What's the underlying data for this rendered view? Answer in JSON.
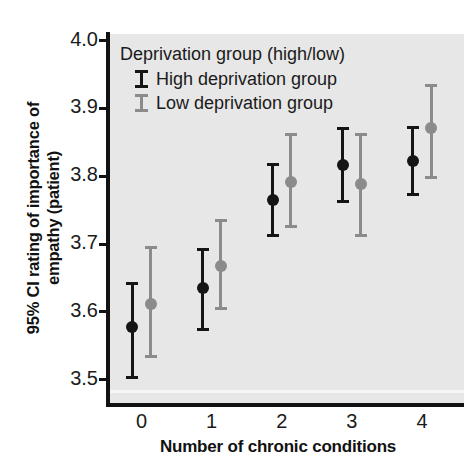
{
  "chart_data": {
    "type": "scatter",
    "title": "",
    "xlabel": "Number of chronic conditions",
    "ylabel": "95% CI rating of importance of empathy (patient)",
    "ylabel_line1": "95% CI rating of importance of",
    "ylabel_line2": "empathy (patient)",
    "legend_title": "Deprivation group (high/low)",
    "legend_position": "top-left-inside",
    "grid": false,
    "categories": [
      "0",
      "1",
      "2",
      "3",
      "4"
    ],
    "x": [
      0,
      1,
      2,
      3,
      4
    ],
    "xlim": [
      -0.45,
      4.6
    ],
    "ylim": [
      3.47,
      4.02
    ],
    "yticks": [
      "3.5",
      "3.6",
      "3.7",
      "3.8",
      "3.9",
      "4.0"
    ],
    "ytick_values": [
      3.5,
      3.6,
      3.7,
      3.8,
      3.9,
      4.0
    ],
    "xticks": [
      "0",
      "1",
      "2",
      "3",
      "4"
    ],
    "series": [
      {
        "name": "High deprivation group",
        "color": "#151515",
        "dodge": -0.13,
        "values": [
          3.578,
          3.635,
          3.765,
          3.817,
          3.822
        ],
        "ci_low": [
          3.501,
          3.572,
          3.711,
          3.76,
          3.771
        ],
        "ci_high": [
          3.644,
          3.694,
          3.819,
          3.872,
          3.874
        ]
      },
      {
        "name": "Low deprivation group",
        "color": "#8b8b8b",
        "dodge": 0.13,
        "values": [
          3.612,
          3.667,
          3.792,
          3.788,
          3.871
        ],
        "ci_low": [
          3.532,
          3.602,
          3.724,
          3.71,
          3.796
        ],
        "ci_high": [
          3.697,
          3.737,
          3.864,
          3.864,
          3.936
        ]
      }
    ]
  },
  "colors": {
    "plot_background": "#e7e7e7",
    "page_background": "#ffffff",
    "axis": "#121212",
    "high_group": "#151515",
    "low_group": "#8b8b8b",
    "text": "#1a1a1a"
  }
}
